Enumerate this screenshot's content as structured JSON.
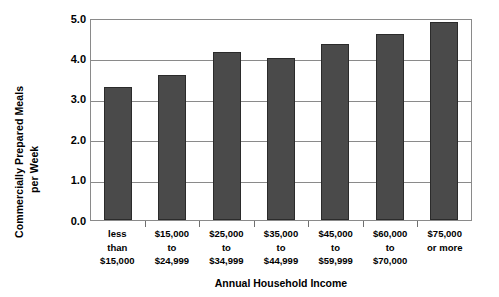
{
  "chart_data": {
    "type": "bar",
    "title": "",
    "xlabel": "Annual Household Income",
    "ylabel": "Commercially Prepared Meals per Week",
    "ylabel_lines": [
      "Commercially Prepared Meals",
      "per Week"
    ],
    "categories": [
      "less than $15,000",
      "$15,000 to $24,999",
      "$25,000 to $34,999",
      "$35,000 to $44,999",
      "$45,000 to $59,999",
      "$60,000 to $70,000",
      "$75,000 or more"
    ],
    "category_lines": [
      [
        "less",
        "than",
        "$15,000"
      ],
      [
        "$15,000",
        "to",
        "$24,999"
      ],
      [
        "$25,000",
        "to",
        "$34,999"
      ],
      [
        "$35,000",
        "to",
        "$44,999"
      ],
      [
        "$45,000",
        "to",
        "$59,999"
      ],
      [
        "$60,000",
        "to",
        "$70,000"
      ],
      [
        "$75,000",
        "or more",
        ""
      ]
    ],
    "values": [
      3.3,
      3.6,
      4.15,
      4.0,
      4.35,
      4.6,
      4.9
    ],
    "ylim": [
      0.0,
      5.0
    ],
    "yticks": [
      5.0,
      4.0,
      3.0,
      2.0,
      1.0,
      0.0
    ],
    "ytick_labels": [
      "5.0",
      "4.0",
      "3.0",
      "2.0",
      "1.0",
      "0.0"
    ],
    "grid": true,
    "legend": false,
    "bar_color": "#4a4a4a",
    "bar_edge_color": "#2b2b2b",
    "grid_color": "#8a8a8a",
    "background_color": "#ffffff"
  }
}
